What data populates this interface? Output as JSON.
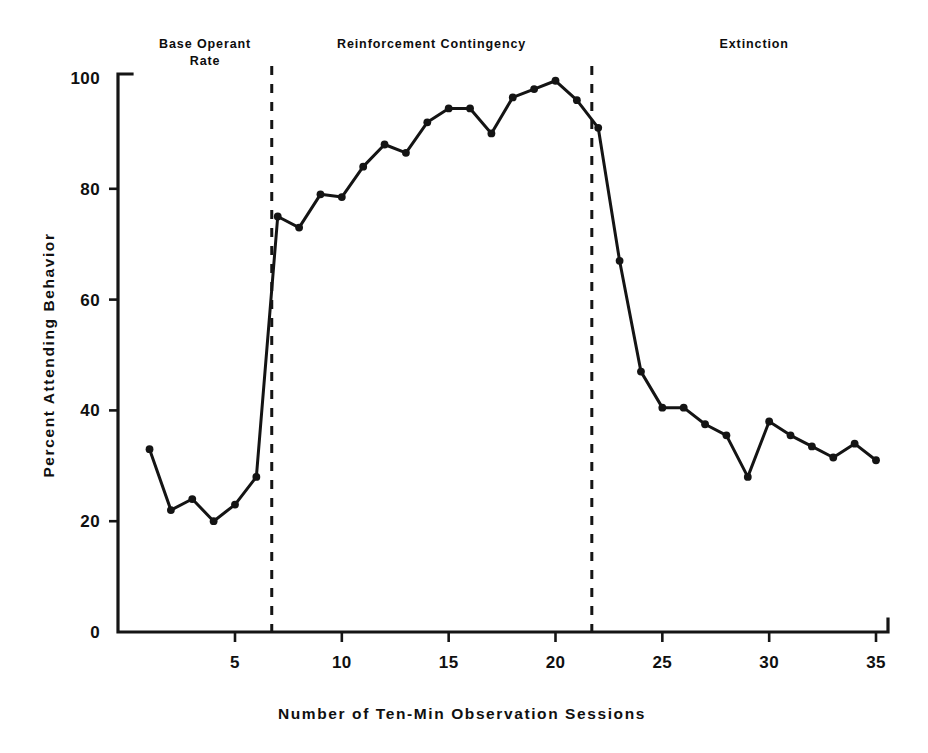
{
  "chart_data": {
    "type": "line",
    "title": "",
    "xlabel": "Number of Ten-Min Observation Sessions",
    "ylabel": "Percent Attending Behavior",
    "xlim": [
      0,
      36
    ],
    "ylim": [
      0,
      100
    ],
    "grid": false,
    "legend": false,
    "xticks": [
      5,
      10,
      15,
      20,
      25,
      30,
      35
    ],
    "yticks": [
      0,
      20,
      40,
      60,
      80,
      100
    ],
    "x": [
      1,
      2,
      3,
      4,
      5,
      6,
      7,
      8,
      9,
      10,
      11,
      12,
      13,
      14,
      15,
      16,
      17,
      18,
      19,
      20,
      21,
      22,
      23,
      24,
      25,
      26,
      27,
      28,
      29,
      30,
      31,
      32,
      33,
      34,
      35
    ],
    "series": [
      {
        "name": "Percent Attending Behavior",
        "color": "#141414",
        "marker": "circle",
        "values": [
          33,
          22,
          24,
          20,
          23,
          28,
          75,
          73,
          79,
          78.5,
          84,
          88,
          86.5,
          92,
          94.5,
          94.5,
          90,
          96.5,
          98,
          99.5,
          96,
          91,
          67,
          47,
          40.5,
          40.5,
          37.5,
          35.5,
          28,
          38,
          35.5,
          33.5,
          31.5,
          34,
          31
        ]
      }
    ],
    "annotations": [
      {
        "name": "base-operant-rate",
        "text_line1": "Base Operant",
        "text_line2": "Rate",
        "center_x": 3.6
      },
      {
        "name": "reinforcement-contingency",
        "text_line1": "Reinforcement Contingency",
        "text_line2": "",
        "center_x": 14.2
      },
      {
        "name": "extinction",
        "text_line1": "Extinction",
        "text_line2": "",
        "center_x": 29.3
      }
    ],
    "phase_dividers": [
      {
        "name": "divider-baseline-to-reinforcement",
        "x": 6.72
      },
      {
        "name": "divider-reinforcement-to-extinction",
        "x": 21.7
      }
    ]
  }
}
